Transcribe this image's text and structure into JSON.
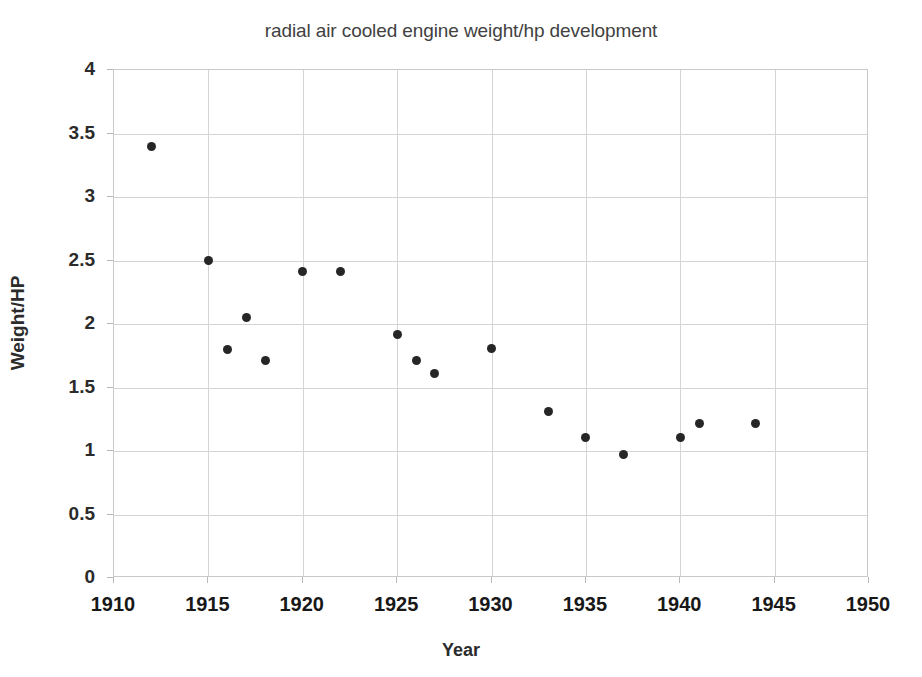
{
  "chart_data": {
    "type": "scatter",
    "title": "radial air cooled engine weight/hp development",
    "xlabel": "Year",
    "ylabel": "Weight/HP",
    "xlim": [
      1910,
      1950
    ],
    "ylim": [
      0,
      4
    ],
    "xticks": [
      1910,
      1915,
      1920,
      1925,
      1930,
      1935,
      1940,
      1945,
      1950
    ],
    "yticks": [
      0,
      0.5,
      1,
      1.5,
      2,
      2.5,
      3,
      3.5,
      4
    ],
    "xtick_labels": [
      "1910",
      "1915",
      "1920",
      "1925",
      "1930",
      "1935",
      "1940",
      "1945",
      "1950"
    ],
    "ytick_labels": [
      "0",
      "0.5",
      "1",
      "1.5",
      "2",
      "2.5",
      "3",
      "3.5",
      "4"
    ],
    "grid": true,
    "legend": null,
    "marker_color": "#262626",
    "series": [
      {
        "name": "radial air cooled engines",
        "points": [
          {
            "x": 1912,
            "y": 3.4
          },
          {
            "x": 1915,
            "y": 2.5
          },
          {
            "x": 1916,
            "y": 1.8
          },
          {
            "x": 1917,
            "y": 2.05
          },
          {
            "x": 1918,
            "y": 1.71
          },
          {
            "x": 1920,
            "y": 2.41
          },
          {
            "x": 1922,
            "y": 2.41
          },
          {
            "x": 1925,
            "y": 1.92
          },
          {
            "x": 1926,
            "y": 1.71
          },
          {
            "x": 1927,
            "y": 1.61
          },
          {
            "x": 1930,
            "y": 1.81
          },
          {
            "x": 1933,
            "y": 1.31
          },
          {
            "x": 1935,
            "y": 1.11
          },
          {
            "x": 1937,
            "y": 0.97
          },
          {
            "x": 1940,
            "y": 1.11
          },
          {
            "x": 1941,
            "y": 1.22
          },
          {
            "x": 1944,
            "y": 1.22
          }
        ]
      }
    ]
  }
}
